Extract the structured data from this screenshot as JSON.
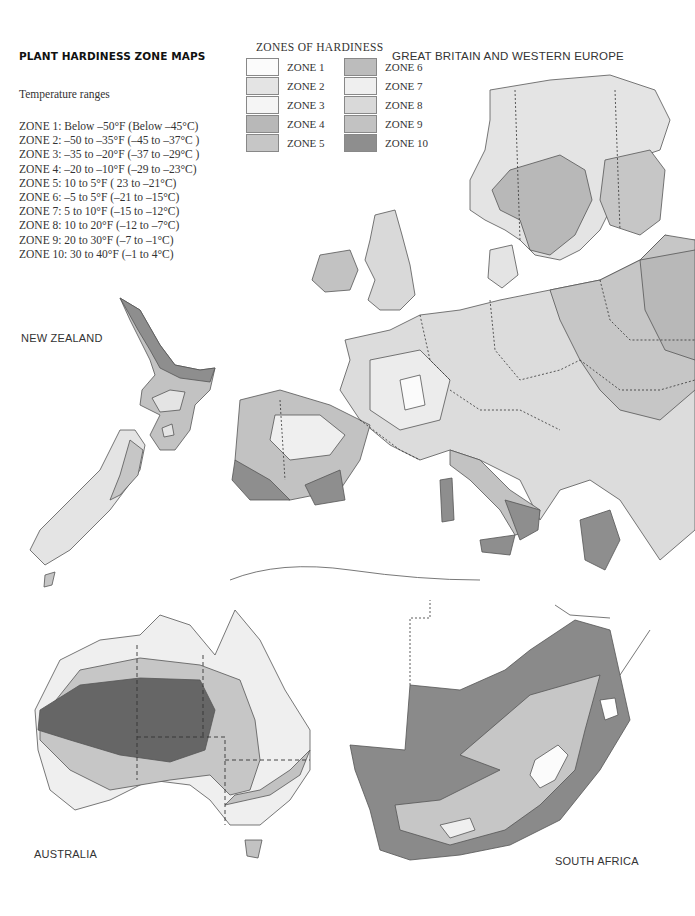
{
  "title": "PLANT HARDINESS ZONE MAPS",
  "temperature_ranges": {
    "heading": "Temperature ranges",
    "items": [
      "ZONE 1: Below –50°F (Below –45°C)",
      "ZONE 2: –50 to –35°F (–45 to –37°C )",
      "ZONE 3: –35 to –20°F (–37 to –29°C )",
      "ZONE 4: –20 to –10°F (–29 to –23°C)",
      "ZONE 5:  10 to  5°F ( 23 to –21°C)",
      "ZONE 6: –5 to 5°F (–21 to –15°C)",
      "ZONE 7: 5 to 10°F (–15 to –12°C)",
      "ZONE 8: 10 to 20°F (–12 to –7°C)",
      "ZONE 9: 20 to 30°F (–7 to –1°C)",
      "ZONE 10: 30 to 40°F (–1 to 4°C)"
    ]
  },
  "legend": {
    "title": "ZONES OF HARDINESS",
    "zones": [
      {
        "label": "ZONE 1",
        "color": "#fbfbfb"
      },
      {
        "label": "ZONE 2",
        "color": "#e4e4e4"
      },
      {
        "label": "ZONE 3",
        "color": "#f5f5f5"
      },
      {
        "label": "ZONE 4",
        "color": "#b8b8b8"
      },
      {
        "label": "ZONE 5",
        "color": "#c6c6c6"
      },
      {
        "label": "ZONE 6",
        "color": "#bcbcbc"
      },
      {
        "label": "ZONE 7",
        "color": "#efefef"
      },
      {
        "label": "ZONE 8",
        "color": "#d9d9d9"
      },
      {
        "label": "ZONE 9",
        "color": "#c2c2c2"
      },
      {
        "label": "ZONE 10",
        "color": "#8e8e8e"
      }
    ]
  },
  "regions": {
    "europe": "GREAT BRITAIN AND WESTERN EUROPE",
    "new_zealand": "NEW ZEALAND",
    "australia": "AUSTRALIA",
    "south_africa": "SOUTH AFRICA"
  }
}
